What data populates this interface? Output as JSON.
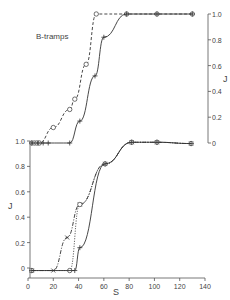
{
  "chart_data": [
    {
      "type": "line",
      "title": "",
      "annotation": "B-tramps",
      "xlabel": "S",
      "ylabel": "J",
      "ylabel_side": "right",
      "xlim": [
        0,
        140
      ],
      "ylim": [
        0,
        1.0
      ],
      "y_ticks": [
        "0",
        "0.2",
        "0.4",
        "0.6",
        "0.8",
        "1.0"
      ],
      "grid": false,
      "series": [
        {
          "name": "circles (dashed)",
          "marker": "circle",
          "line": "dashed",
          "points": [
            [
              3,
              0
            ],
            [
              5,
              0
            ],
            [
              7,
              0
            ],
            [
              9,
              0
            ],
            [
              20,
              0.12
            ],
            [
              33,
              0.26
            ],
            [
              37,
              0.34
            ],
            [
              46,
              0.61
            ],
            [
              54,
              1.0
            ],
            [
              78,
              1.0
            ],
            [
              102,
              1.0
            ],
            [
              130,
              1.0
            ]
          ]
        },
        {
          "name": "crosses (solid)",
          "marker": "plus",
          "line": "solid",
          "points": [
            [
              3,
              0
            ],
            [
              8,
              0
            ],
            [
              12,
              0
            ],
            [
              16,
              0
            ],
            [
              33,
              0
            ],
            [
              41,
              0.17
            ],
            [
              53,
              0.52
            ],
            [
              60,
              0.82
            ],
            [
              78,
              1.0
            ],
            [
              102,
              1.0
            ],
            [
              130,
              1.0
            ]
          ]
        }
      ]
    },
    {
      "type": "line",
      "title": "",
      "xlabel": "S",
      "ylabel": "J",
      "ylabel_side": "left",
      "xlim": [
        0,
        140
      ],
      "ylim": [
        0,
        1.0
      ],
      "x_ticks": [
        "0",
        "20",
        "40",
        "60",
        "80",
        "100",
        "120",
        "140"
      ],
      "y_ticks": [
        "0",
        "0.2",
        "0.4",
        "0.6",
        "0.8",
        "1.0"
      ],
      "grid": false,
      "series": [
        {
          "name": "x markers (dash-dot)",
          "marker": "x",
          "line": "dashdot",
          "points": [
            [
              3,
              -0.02
            ],
            [
              20,
              -0.02
            ],
            [
              31,
              0.24
            ],
            [
              41,
              0.5
            ],
            [
              61,
              0.82
            ],
            [
              82,
              0.99
            ],
            [
              102,
              0.99
            ],
            [
              129,
              0.98
            ]
          ]
        },
        {
          "name": "circles (dotted)",
          "marker": "circle",
          "line": "dotted",
          "points": [
            [
              3,
              -0.02
            ],
            [
              33,
              -0.02
            ],
            [
              41,
              0.5
            ],
            [
              61,
              0.82
            ],
            [
              82,
              0.99
            ],
            [
              102,
              0.99
            ],
            [
              129,
              0.98
            ]
          ]
        },
        {
          "name": "crosses (solid)",
          "marker": "plus",
          "line": "solid",
          "points": [
            [
              3,
              -0.02
            ],
            [
              37,
              -0.02
            ],
            [
              41,
              0.16
            ],
            [
              61,
              0.82
            ],
            [
              82,
              0.99
            ],
            [
              102,
              0.99
            ],
            [
              129,
              0.98
            ]
          ]
        }
      ]
    }
  ],
  "upper": {
    "label": "B-tramps",
    "ylabel": "J",
    "ticks": [
      "0",
      "0.2",
      "0.4",
      "0.6",
      "0.8",
      "1.0"
    ]
  },
  "lower": {
    "ylabel": "J",
    "xlabel": "S",
    "yticks": [
      "0",
      "0.2",
      "0.4",
      "0.6",
      "0.8",
      "1.0"
    ],
    "xticks": [
      "0",
      "20",
      "40",
      "60",
      "80",
      "100",
      "120",
      "140"
    ]
  }
}
